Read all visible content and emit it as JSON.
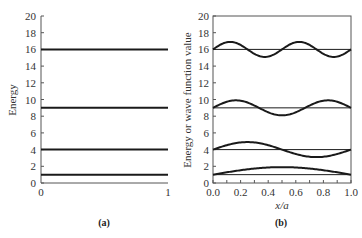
{
  "chart_data": [
    {
      "panel": "(a)",
      "type": "line",
      "title": "",
      "xlabel": "",
      "ylabel": "Energy",
      "xlim": [
        0,
        1
      ],
      "ylim": [
        0,
        20
      ],
      "x_ticks": [
        "0",
        "1"
      ],
      "y_ticks": [
        "0",
        "2",
        "4",
        "6",
        "8",
        "10",
        "12",
        "14",
        "16",
        "18",
        "20"
      ],
      "grid": false,
      "series": [
        {
          "name": "n=1",
          "x": [
            0,
            1
          ],
          "values": [
            1,
            1
          ]
        },
        {
          "name": "n=2",
          "x": [
            0,
            1
          ],
          "values": [
            4,
            4
          ]
        },
        {
          "name": "n=3",
          "x": [
            0,
            1
          ],
          "values": [
            9,
            9
          ]
        },
        {
          "name": "n=4",
          "x": [
            0,
            1
          ],
          "values": [
            16,
            16
          ]
        }
      ]
    },
    {
      "panel": "(b)",
      "type": "line",
      "title": "",
      "xlabel": "x/a",
      "ylabel": "Energy or wave function value",
      "xlim": [
        0,
        1
      ],
      "ylim": [
        0,
        20
      ],
      "x_ticks": [
        "0.0",
        "0.2",
        "0.4",
        "0.6",
        "0.8",
        "1.0"
      ],
      "y_ticks": [
        "0",
        "2",
        "4",
        "6",
        "8",
        "10",
        "12",
        "14",
        "16",
        "18",
        "20"
      ],
      "grid": false,
      "series": [
        {
          "name": "E1 level",
          "values": [
            1,
            1
          ]
        },
        {
          "name": "psi1",
          "baseline": 1,
          "n": 1,
          "amplitude": 0.9
        },
        {
          "name": "E2 level",
          "values": [
            4,
            4
          ]
        },
        {
          "name": "psi2",
          "baseline": 4,
          "n": 2,
          "amplitude": 0.9
        },
        {
          "name": "E3 level",
          "values": [
            9,
            9
          ]
        },
        {
          "name": "psi3",
          "baseline": 9,
          "n": 3,
          "amplitude": 0.9
        },
        {
          "name": "E4 level",
          "values": [
            16,
            16
          ]
        },
        {
          "name": "psi4",
          "baseline": 16,
          "n": 4,
          "amplitude": 0.9
        }
      ]
    }
  ],
  "labels": {
    "panel_a": "(a)",
    "panel_b": "(b)",
    "ylabel_a": "Energy",
    "ylabel_b": "Energy or wave function value",
    "xlabel_b": "x/a"
  },
  "colors": {
    "line": "#1a1a1a",
    "axis": "#555555"
  }
}
